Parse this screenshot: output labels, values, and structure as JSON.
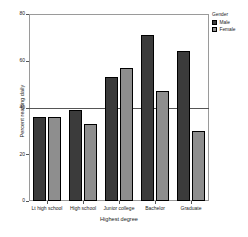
{
  "chart_data": {
    "type": "bar",
    "title": "",
    "subtitle": "",
    "xlabel": "Highest degree",
    "ylabel": "Percent reading daily",
    "categories": [
      "Lt high school",
      "High school",
      "Junior college",
      "Bachelor",
      "Graduate"
    ],
    "series": [
      {
        "name": "Male",
        "color": "#3b3b3b",
        "values": [
          36,
          39,
          53,
          71,
          64
        ]
      },
      {
        "name": "Female",
        "color": "#8e8e8e",
        "values": [
          36,
          33,
          57,
          47,
          30
        ]
      }
    ],
    "ylim": [
      0,
      80
    ],
    "yticks": [
      0,
      20,
      40,
      60,
      80
    ],
    "ytick_labels": [
      "0",
      "20",
      "40",
      "60",
      "80"
    ],
    "grid": false,
    "reference_line": {
      "value": 40,
      "orientation": "horizontal",
      "color": "#555555"
    },
    "legend": {
      "title": "Gender",
      "position": "right-top"
    }
  }
}
